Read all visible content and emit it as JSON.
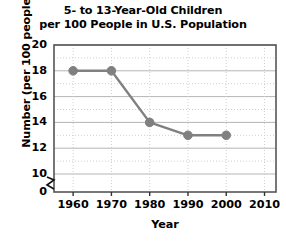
{
  "chart_data": {
    "type": "line",
    "title": "5- to 13-Year-Old Children per 100 People in U.S. Population",
    "title_lines": [
      "5- to 13-Year-Old Children",
      "per 100 People in U.S. Population"
    ],
    "xlabel": "Year",
    "ylabel": "Number (per 100 people)",
    "x": [
      1960,
      1970,
      1980,
      1990,
      2000
    ],
    "values": [
      18,
      18,
      14,
      13,
      13
    ],
    "series": [
      {
        "name": "Children per 100 people",
        "values": [
          18,
          18,
          14,
          13,
          13
        ]
      }
    ],
    "points": [
      {
        "x": 1960,
        "y": 18
      },
      {
        "x": 1970,
        "y": 18
      },
      {
        "x": 1980,
        "y": 14
      },
      {
        "x": 1990,
        "y": 13
      },
      {
        "x": 2000,
        "y": 13
      }
    ],
    "xlim": [
      1955,
      2013
    ],
    "ylim": [
      0,
      20
    ],
    "y_axis_break": true,
    "y_break_between": [
      0,
      10
    ],
    "xticks": [
      1960,
      1970,
      1980,
      1990,
      2000,
      2010
    ],
    "xtick_labels": [
      "1960",
      "1970",
      "1980",
      "1990",
      "2000",
      "2010"
    ],
    "yticks": [
      0,
      10,
      12,
      14,
      16,
      18,
      20
    ],
    "ytick_labels": [
      "0",
      "10",
      "12",
      "14",
      "16",
      "18",
      "20"
    ],
    "y_minor_ticks": [
      11,
      13,
      15,
      17,
      19
    ],
    "grid": true,
    "grid_major_color": "#b5b5b5",
    "grid_minor_color": "#cfcfcf",
    "legend": null,
    "line_color": "#808080",
    "marker_color": "#808080",
    "marker": "circle",
    "axis_color": "#555555",
    "background": "#ffffff"
  }
}
